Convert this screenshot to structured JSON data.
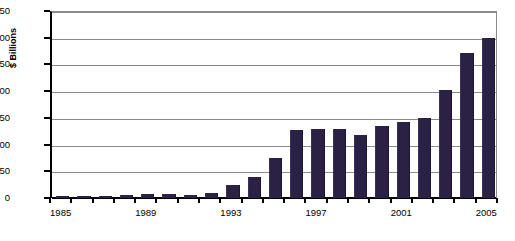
{
  "chart_data": {
    "type": "bar",
    "title": "",
    "xlabel": "",
    "ylabel": "$ Billions",
    "ylim": [
      0,
      350
    ],
    "ytick_step": 50,
    "yticks": [
      0,
      50,
      100,
      150,
      200,
      250,
      300,
      350
    ],
    "ytick_labels": [
      "0",
      "50",
      "100",
      "150",
      "200",
      "250",
      "300",
      "350"
    ],
    "grid": "horizontal",
    "legend": "none",
    "bar_color": "#2a2145",
    "categories": [
      "1985",
      "1986",
      "1987",
      "1988",
      "1989",
      "1990",
      "1991",
      "1992",
      "1993",
      "1994",
      "1995",
      "1996",
      "1997",
      "1998",
      "1999",
      "2000",
      "2001",
      "2002",
      "2003",
      "2004",
      "2005"
    ],
    "xtick_labels_shown": [
      "1985",
      "1989",
      "1993",
      "1997",
      "2001",
      "2005"
    ],
    "values": [
      3,
      4,
      4,
      5,
      8,
      7,
      6,
      10,
      25,
      40,
      75,
      128,
      130,
      129,
      118,
      135,
      143,
      150,
      203,
      272,
      300
    ],
    "series": [
      {
        "name": "$ Billions",
        "values": [
          3,
          4,
          4,
          5,
          8,
          7,
          6,
          10,
          25,
          40,
          75,
          128,
          130,
          129,
          118,
          135,
          143,
          150,
          203,
          272,
          300
        ]
      }
    ]
  }
}
